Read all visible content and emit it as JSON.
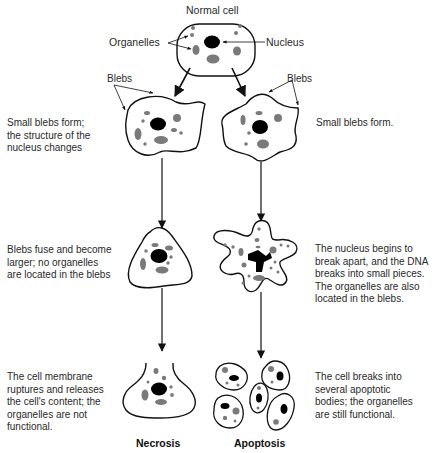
{
  "diagram": {
    "top": {
      "title": "Normal cell",
      "labels": {
        "organelles": "Organelles",
        "nucleus": "Nucleus"
      }
    },
    "blebs_label_left": "Blebs",
    "blebs_label_right": "Blebs",
    "necrosis": {
      "title": "Necrosis",
      "steps": [
        {
          "description": [
            "Small blebs form;",
            "the structure of the",
            "nucleus changes"
          ]
        },
        {
          "description": [
            "Blebs fuse and become",
            "larger; no organelles",
            "are located in the blebs"
          ]
        },
        {
          "description": [
            "The cell membrane",
            "ruptures and releases",
            "the cell's content; the",
            "organelles are not",
            "functional."
          ]
        }
      ]
    },
    "apoptosis": {
      "title": "Apoptosis",
      "steps": [
        {
          "description": [
            "Small blebs form."
          ]
        },
        {
          "description": [
            "The nucleus begins to",
            "break apart, and the DNA",
            "breaks into small pieces.",
            "The organelles are also",
            "located in the blebs."
          ]
        },
        {
          "description": [
            "The cell breaks into",
            "several apoptotic",
            "bodies; the organelles",
            "are still functional."
          ]
        }
      ]
    },
    "colors": {
      "outline": "#111111",
      "nucleus": "#000000",
      "organelle": "#7a7a7a"
    }
  }
}
